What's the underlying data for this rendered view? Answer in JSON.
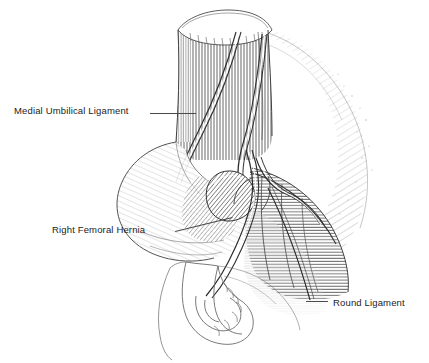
{
  "figure": {
    "background_color": "#ffffff",
    "ink_color": "#2a2a2a",
    "label_color": "#1b1b1b"
  },
  "labels": [
    {
      "id": "medial-umbilical-ligament",
      "text": "Medial Umbilical Ligament",
      "x": 14,
      "y": 106,
      "leader": {
        "x1": 150,
        "y1": 113,
        "x2": 196,
        "y2": 113
      }
    },
    {
      "id": "right-femoral-hernia",
      "text": "Right Femoral Hernia",
      "x": 52,
      "y": 225,
      "leader": {
        "x1": 175,
        "y1": 231,
        "x2": 232,
        "y2": 217
      }
    },
    {
      "id": "round-ligament",
      "text": "Round Ligament",
      "x": 333,
      "y": 298,
      "leader": {
        "x1": 306,
        "y1": 301,
        "x2": 328,
        "y2": 301
      }
    }
  ],
  "structures": [
    {
      "id": "rectus-abdominis-cut-end",
      "name": "Rectus abdominis muscle, cut cross-section"
    },
    {
      "id": "external-oblique-aponeurosis",
      "name": "External oblique aponeurosis, fanned fibers"
    },
    {
      "id": "peritoneal-fold-bladder",
      "name": "Peritoneal fold over bladder"
    },
    {
      "id": "hernia-sac",
      "name": "Femoral hernia sac"
    },
    {
      "id": "femoral-vessels",
      "name": "Femoral vessels and cord structures"
    },
    {
      "id": "inguinal-ligament-region",
      "name": "Inguinal ligament and femoral sheath region"
    },
    {
      "id": "pubic-bone",
      "name": "Pubic bone and symphysis"
    }
  ]
}
